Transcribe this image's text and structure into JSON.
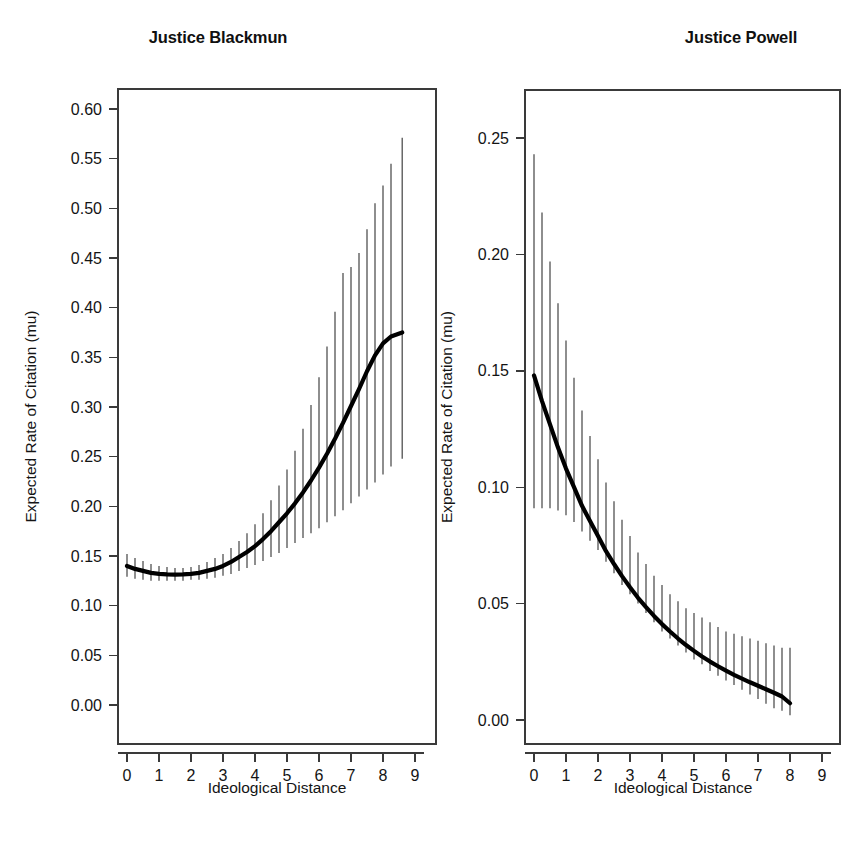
{
  "figure": {
    "background": "#ffffff",
    "line_color": "#000000",
    "errorbar_color": "#4a4a4a",
    "axis_color": "#3a3a3a"
  },
  "panels": [
    {
      "key": "blackmun",
      "title": "Justice Blackmun"
    },
    {
      "key": "powell",
      "title": "Justice Powell"
    }
  ],
  "chart_data": [
    {
      "type": "line",
      "title": "Justice Blackmun",
      "xlabel": "Ideological Distance",
      "ylabel": "Expected Rate of Citation (mu)",
      "xlim": [
        -0.35,
        9.35
      ],
      "ylim": [
        -0.018,
        0.632
      ],
      "xticks": [
        0,
        1,
        2,
        3,
        4,
        5,
        6,
        7,
        8,
        9
      ],
      "xticklabels": [
        "0",
        "1",
        "2",
        "3",
        "4",
        "5",
        "6",
        "7",
        "8",
        "9"
      ],
      "yticks": [
        0.0,
        0.05,
        0.1,
        0.15,
        0.2,
        0.25,
        0.3,
        0.35,
        0.4,
        0.45,
        0.5,
        0.55,
        0.6
      ],
      "yticklabels": [
        "0.00",
        "0.05",
        "0.10",
        "0.15",
        "0.20",
        "0.25",
        "0.30",
        "0.35",
        "0.40",
        "0.45",
        "0.50",
        "0.55",
        "0.60"
      ],
      "grid": false,
      "legend": "none",
      "series": [
        {
          "name": "Expected rate of citation",
          "x": [
            0.0,
            0.25,
            0.5,
            0.75,
            1.0,
            1.25,
            1.5,
            1.75,
            2.0,
            2.25,
            2.5,
            2.75,
            3.0,
            3.25,
            3.5,
            3.75,
            4.0,
            4.25,
            4.5,
            4.75,
            5.0,
            5.25,
            5.5,
            5.75,
            6.0,
            6.25,
            6.5,
            6.75,
            7.0,
            7.25,
            7.5,
            7.75,
            8.0,
            8.25,
            8.6
          ],
          "y": [
            0.14,
            0.137,
            0.135,
            0.133,
            0.132,
            0.1315,
            0.1312,
            0.1315,
            0.132,
            0.133,
            0.135,
            0.137,
            0.14,
            0.144,
            0.149,
            0.154,
            0.16,
            0.167,
            0.175,
            0.184,
            0.193,
            0.203,
            0.214,
            0.226,
            0.239,
            0.253,
            0.268,
            0.284,
            0.301,
            0.318,
            0.336,
            0.352,
            0.364,
            0.371,
            0.375
          ],
          "ci_lower": [
            0.129,
            0.127,
            0.126,
            0.125,
            0.125,
            0.125,
            0.125,
            0.125,
            0.126,
            0.126,
            0.127,
            0.128,
            0.13,
            0.132,
            0.135,
            0.138,
            0.141,
            0.145,
            0.149,
            0.153,
            0.158,
            0.163,
            0.168,
            0.173,
            0.178,
            0.184,
            0.19,
            0.196,
            0.203,
            0.21,
            0.217,
            0.224,
            0.232,
            0.24,
            0.248
          ],
          "ci_upper": [
            0.152,
            0.148,
            0.145,
            0.142,
            0.14,
            0.139,
            0.138,
            0.138,
            0.139,
            0.141,
            0.144,
            0.148,
            0.152,
            0.158,
            0.165,
            0.173,
            0.182,
            0.193,
            0.206,
            0.221,
            0.237,
            0.256,
            0.278,
            0.302,
            0.33,
            0.361,
            0.396,
            0.435,
            0.441,
            0.455,
            0.479,
            0.505,
            0.523,
            0.545,
            0.571
          ]
        }
      ]
    },
    {
      "type": "line",
      "title": "Justice Powell",
      "xlabel": "Ideological Distance",
      "ylabel": "Expected Rate of Citation (mu)",
      "xlim": [
        -0.35,
        9.35
      ],
      "ylim": [
        -0.008,
        0.272
      ],
      "xticks": [
        0,
        1,
        2,
        3,
        4,
        5,
        6,
        7,
        8,
        9
      ],
      "xticklabels": [
        "0",
        "1",
        "2",
        "3",
        "4",
        "5",
        "6",
        "7",
        "8",
        "9"
      ],
      "yticks": [
        0.0,
        0.05,
        0.1,
        0.15,
        0.2,
        0.25
      ],
      "yticklabels": [
        "0.00",
        "0.05",
        "0.10",
        "0.15",
        "0.20",
        "0.25"
      ],
      "grid": false,
      "legend": "none",
      "series": [
        {
          "name": "Expected rate of citation",
          "x": [
            0.0,
            0.25,
            0.5,
            0.75,
            1.0,
            1.25,
            1.5,
            1.75,
            2.0,
            2.25,
            2.5,
            2.75,
            3.0,
            3.25,
            3.5,
            3.75,
            4.0,
            4.25,
            4.5,
            4.75,
            5.0,
            5.25,
            5.5,
            5.75,
            6.0,
            6.25,
            6.5,
            6.75,
            7.0,
            7.25,
            7.5,
            7.75,
            8.0
          ],
          "y": [
            0.148,
            0.137,
            0.127,
            0.117,
            0.108,
            0.1,
            0.092,
            0.0855,
            0.079,
            0.0725,
            0.067,
            0.0618,
            0.057,
            0.0525,
            0.0485,
            0.0447,
            0.0412,
            0.038,
            0.035,
            0.0322,
            0.0297,
            0.0273,
            0.0251,
            0.0231,
            0.0212,
            0.0194,
            0.0178,
            0.0162,
            0.0147,
            0.0132,
            0.0117,
            0.0101,
            0.0072
          ],
          "ci_lower": [
            0.091,
            0.091,
            0.091,
            0.09,
            0.088,
            0.085,
            0.081,
            0.077,
            0.073,
            0.068,
            0.063,
            0.058,
            0.054,
            0.05,
            0.046,
            0.042,
            0.038,
            0.035,
            0.032,
            0.029,
            0.026,
            0.024,
            0.021,
            0.019,
            0.017,
            0.015,
            0.013,
            0.011,
            0.009,
            0.007,
            0.005,
            0.004,
            0.002
          ],
          "ci_upper": [
            0.243,
            0.218,
            0.197,
            0.179,
            0.163,
            0.147,
            0.133,
            0.122,
            0.112,
            0.102,
            0.094,
            0.086,
            0.079,
            0.072,
            0.067,
            0.062,
            0.058,
            0.054,
            0.051,
            0.048,
            0.046,
            0.044,
            0.042,
            0.04,
            0.038,
            0.037,
            0.036,
            0.035,
            0.034,
            0.033,
            0.032,
            0.031,
            0.031
          ]
        }
      ]
    }
  ]
}
